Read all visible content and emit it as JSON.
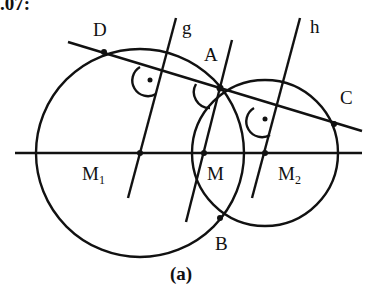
{
  "figure": {
    "header_fragment": ".07:",
    "caption": "(a)",
    "points": {
      "A": "A",
      "B": "B",
      "C": "C",
      "D": "D",
      "M": "M",
      "M1_base": "M",
      "M1_sub": "1",
      "M2_base": "M",
      "M2_sub": "2"
    },
    "lines": {
      "g": "g",
      "h": "h"
    },
    "stroke_color": "#111111",
    "background": "#ffffff"
  }
}
